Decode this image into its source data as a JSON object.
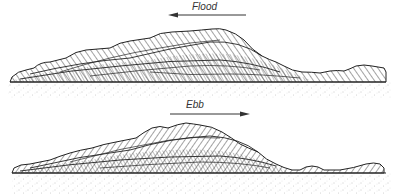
{
  "diagram": {
    "type": "sedimentary cross-section",
    "panels": [
      {
        "id": "flood",
        "label": "Flood",
        "arrow_direction": "left",
        "description": "Large cross-stratified sand body; foresets dipping left (flood-directed), smaller bedforms to the right"
      },
      {
        "id": "ebb",
        "label": "Ebb",
        "arrow_direction": "right",
        "description": "Cross-stratified sand body reworked; foresets dipping right (ebb-directed), small bedforms at right"
      }
    ],
    "substrate": "stippled sand base",
    "colors": {
      "line": "#222222",
      "hatch": "#444444",
      "stipple": "#888888",
      "background": "#ffffff"
    }
  }
}
